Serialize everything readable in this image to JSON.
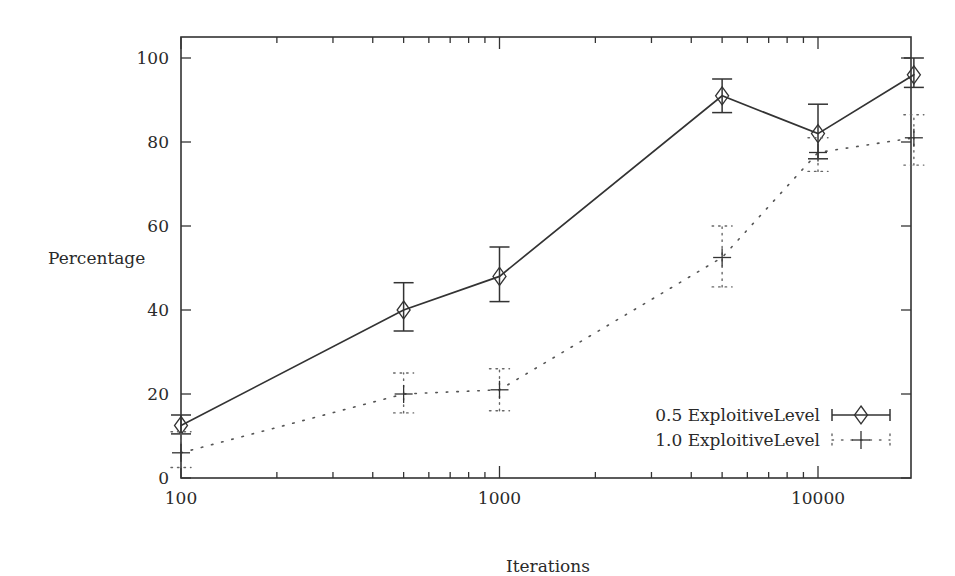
{
  "chart_data": {
    "type": "line",
    "title": "",
    "xlabel": "Iterations",
    "ylabel": "Percentage",
    "xscale": "log",
    "xlim": [
      100,
      20000
    ],
    "ylim": [
      0,
      105
    ],
    "x_tick_labels": [
      "100",
      "1000",
      "10000"
    ],
    "y_tick_labels": [
      "0",
      "20",
      "40",
      "60",
      "80",
      "100"
    ],
    "grid": false,
    "legend_position": "lower right",
    "x": [
      100,
      500,
      1000,
      5000,
      10000,
      20000
    ],
    "series": [
      {
        "name": "0.5 ExploitiveLevel",
        "line_style": "solid",
        "marker": "diamond",
        "color": "#333333",
        "values": [
          12.5,
          40,
          48,
          91,
          82,
          96
        ],
        "error_low": [
          10.5,
          35,
          42,
          87,
          76,
          93
        ],
        "error_high": [
          15,
          46.5,
          55,
          95,
          89,
          100
        ]
      },
      {
        "name": "1.0 ExploitiveLevel",
        "line_style": "dotted",
        "marker": "plus",
        "color": "#555555",
        "values": [
          6,
          20,
          21,
          52.5,
          77.5,
          81
        ],
        "error_low": [
          2.5,
          15.5,
          16,
          45.5,
          73,
          74.5
        ],
        "error_high": [
          11,
          25,
          26,
          60,
          81,
          86.5
        ]
      }
    ]
  }
}
